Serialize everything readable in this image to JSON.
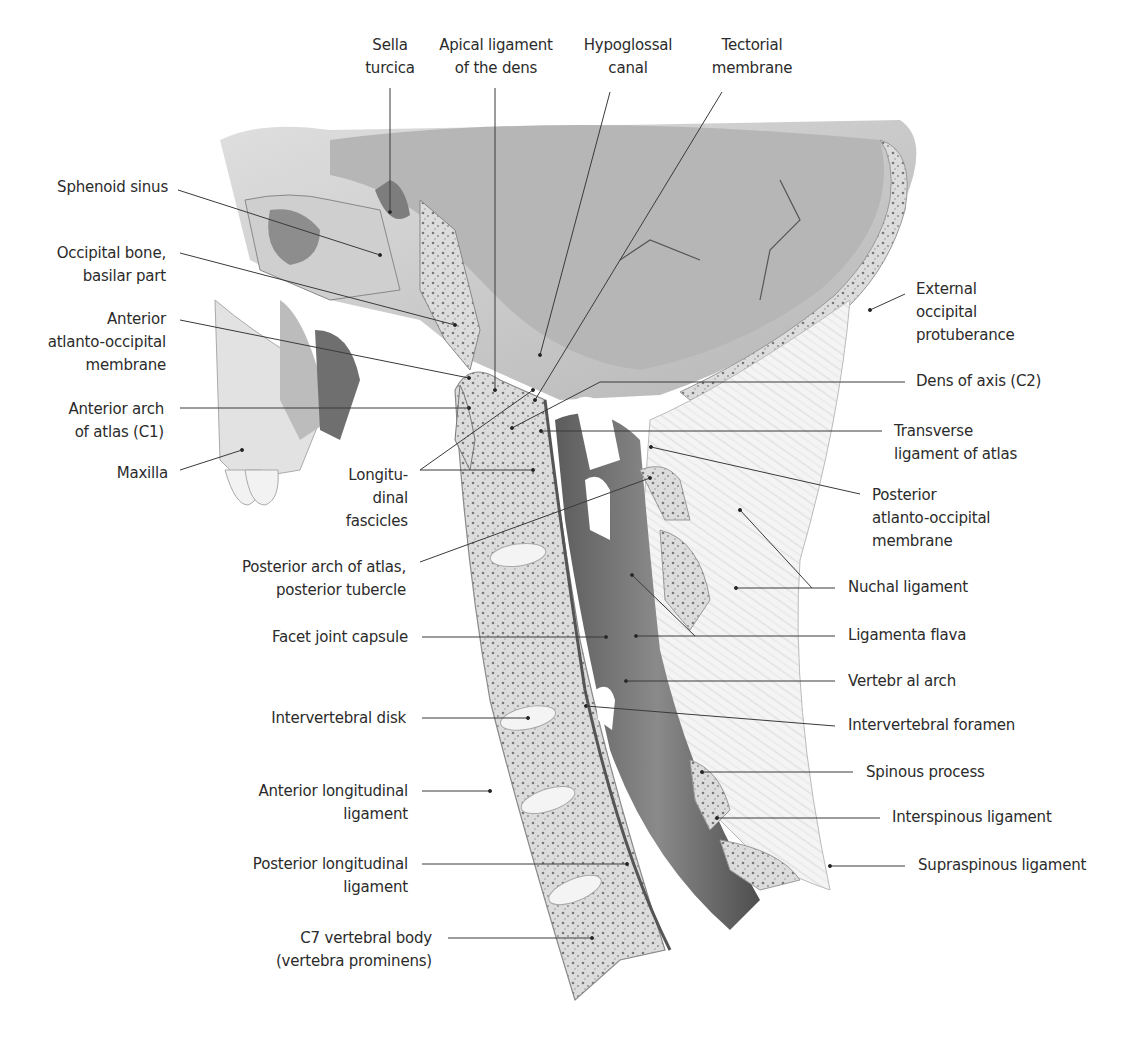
{
  "figure": {
    "background": "#ffffff",
    "text_color": "#2b2b2b",
    "line_color": "#3a3a3a"
  },
  "labels": [
    {
      "id": "sella-turcica",
      "text": "Sella\nturcica",
      "x": 390,
      "y": 34,
      "align": "c",
      "w": 80,
      "line": [
        [
          390,
          88
        ],
        [
          390,
          212
        ]
      ]
    },
    {
      "id": "apical-ligament",
      "text": "Apical ligament\nof the dens",
      "x": 496,
      "y": 34,
      "align": "c",
      "w": 140,
      "line": [
        [
          495,
          88
        ],
        [
          495,
          390
        ]
      ]
    },
    {
      "id": "hypoglossal-canal",
      "text": "Hypoglossal\ncanal",
      "x": 628,
      "y": 34,
      "align": "c",
      "w": 110,
      "line": [
        [
          610,
          92
        ],
        [
          540,
          355
        ]
      ]
    },
    {
      "id": "tectorial-membrane",
      "text": "Tectorial\nmembrane",
      "x": 752,
      "y": 34,
      "align": "c",
      "w": 110,
      "line": [
        [
          722,
          92
        ],
        [
          535,
          400
        ]
      ]
    },
    {
      "id": "sphenoid-sinus",
      "text": "Sphenoid sinus",
      "x": 168,
      "y": 176,
      "align": "r",
      "w": 170,
      "line": [
        [
          178,
          190
        ],
        [
          380,
          255
        ]
      ]
    },
    {
      "id": "occipital-bone",
      "text": "Occipital bone,\nbasilar part",
      "x": 166,
      "y": 242,
      "align": "r",
      "w": 170,
      "line": [
        [
          180,
          253
        ],
        [
          455,
          325
        ]
      ]
    },
    {
      "id": "anterior-atlanto-occipital-membrane",
      "text": "Anterior\natlanto-occipital\nmembrane",
      "x": 166,
      "y": 308,
      "align": "r",
      "w": 170,
      "line": [
        [
          180,
          320
        ],
        [
          469,
          378
        ]
      ]
    },
    {
      "id": "anterior-arch-atlas",
      "text": "Anterior arch\nof atlas (C1)",
      "x": 164,
      "y": 398,
      "align": "r",
      "w": 170,
      "line": [
        [
          180,
          408
        ],
        [
          469,
          408
        ]
      ]
    },
    {
      "id": "maxilla",
      "text": "Maxilla",
      "x": 168,
      "y": 462,
      "align": "r",
      "w": 170,
      "line": [
        [
          180,
          470
        ],
        [
          242,
          450
        ]
      ]
    },
    {
      "id": "longitudinal-fascicles",
      "text": "Longitu-\ndinal\nfascicles",
      "x": 408,
      "y": 464,
      "align": "r",
      "w": 90,
      "lines": [
        [
          [
            420,
            470
          ],
          [
            533,
            390
          ]
        ],
        [
          [
            420,
            470
          ],
          [
            533,
            470
          ]
        ]
      ]
    },
    {
      "id": "posterior-arch-atlas",
      "text": "Posterior arch of atlas,\nposterior tubercle",
      "x": 406,
      "y": 556,
      "align": "r",
      "w": 200,
      "line": [
        [
          420,
          562
        ],
        [
          650,
          478
        ]
      ]
    },
    {
      "id": "dens-of-axis",
      "text": "Dens of axis (C2)",
      "x": 916,
      "y": 370,
      "align": "l",
      "w": 160,
      "line": [
        [
          905,
          382
        ],
        [
          600,
          382
        ],
        [
          512,
          428
        ]
      ]
    },
    {
      "id": "transverse-ligament",
      "text": "Transverse\nligament of atlas",
      "x": 894,
      "y": 420,
      "align": "l",
      "w": 160,
      "line": [
        [
          882,
          431
        ],
        [
          541,
          431
        ]
      ]
    },
    {
      "id": "external-occipital-protuberance",
      "text": "External\noccipital\nprotuberance",
      "x": 916,
      "y": 278,
      "align": "l",
      "w": 150,
      "line": [
        [
          905,
          294
        ],
        [
          870,
          310
        ]
      ]
    },
    {
      "id": "posterior-atlanto-occipital-membrane",
      "text": "Posterior\natlanto-occipital\nmembrane",
      "x": 872,
      "y": 484,
      "align": "l",
      "w": 180,
      "line": [
        [
          860,
          494
        ],
        [
          651,
          447
        ]
      ]
    },
    {
      "id": "nuchal-ligament",
      "text": "Nuchal ligament",
      "x": 848,
      "y": 576,
      "align": "l",
      "w": 170,
      "lines": [
        [
          [
            835,
            588
          ],
          [
            812,
            588
          ],
          [
            740,
            510
          ]
        ],
        [
          [
            812,
            588
          ],
          [
            736,
            588
          ]
        ]
      ]
    },
    {
      "id": "ligamenta-flava",
      "text": "Ligamenta flava",
      "x": 848,
      "y": 624,
      "align": "l",
      "w": 170,
      "lines": [
        [
          [
            835,
            636
          ],
          [
            636,
            636
          ]
        ],
        [
          [
            695,
            636
          ],
          [
            632,
            575
          ]
        ]
      ]
    },
    {
      "id": "vertebral-arch",
      "text": "Vertebr al arch",
      "x": 848,
      "y": 670,
      "align": "l",
      "w": 170,
      "line": [
        [
          835,
          681
        ],
        [
          626,
          681
        ]
      ]
    },
    {
      "id": "intervertebral-foramen",
      "text": "Intervertebral foramen",
      "x": 848,
      "y": 714,
      "align": "l",
      "w": 200,
      "line": [
        [
          835,
          726
        ],
        [
          586,
          706
        ]
      ]
    },
    {
      "id": "spinous-process",
      "text": "Spinous process",
      "x": 866,
      "y": 761,
      "align": "l",
      "w": 170,
      "line": [
        [
          853,
          772
        ],
        [
          702,
          772
        ]
      ]
    },
    {
      "id": "interspinous-ligament",
      "text": "Interspinous ligament",
      "x": 892,
      "y": 806,
      "align": "l",
      "w": 200,
      "line": [
        [
          880,
          818
        ],
        [
          717,
          818
        ]
      ]
    },
    {
      "id": "supraspinous-ligament",
      "text": "Supraspinous ligament",
      "x": 918,
      "y": 854,
      "align": "l",
      "w": 200,
      "line": [
        [
          905,
          866
        ],
        [
          830,
          866
        ]
      ]
    },
    {
      "id": "facet-joint-capsule",
      "text": "Facet joint capsule",
      "x": 408,
      "y": 626,
      "align": "r",
      "w": 190,
      "line": [
        [
          422,
          637
        ],
        [
          606,
          637
        ]
      ]
    },
    {
      "id": "intervertebral-disk",
      "text": "Intervertebral disk",
      "x": 406,
      "y": 707,
      "align": "r",
      "w": 190,
      "line": [
        [
          422,
          718
        ],
        [
          528,
          718
        ]
      ]
    },
    {
      "id": "anterior-longitudinal-ligament",
      "text": "Anterior longitudinal\nligament",
      "x": 408,
      "y": 780,
      "align": "r",
      "w": 190,
      "line": [
        [
          422,
          791
        ],
        [
          490,
          791
        ]
      ]
    },
    {
      "id": "posterior-longitudinal-ligament",
      "text": "Posterior longitudinal\nligament",
      "x": 408,
      "y": 853,
      "align": "r",
      "w": 190,
      "line": [
        [
          422,
          864
        ],
        [
          627,
          864
        ]
      ]
    },
    {
      "id": "c7-vertebral-body",
      "text": "C7 vertebral body\n(vertebra prominens)",
      "x": 432,
      "y": 927,
      "align": "r",
      "w": 200,
      "line": [
        [
          448,
          938
        ],
        [
          592,
          938
        ]
      ]
    }
  ]
}
